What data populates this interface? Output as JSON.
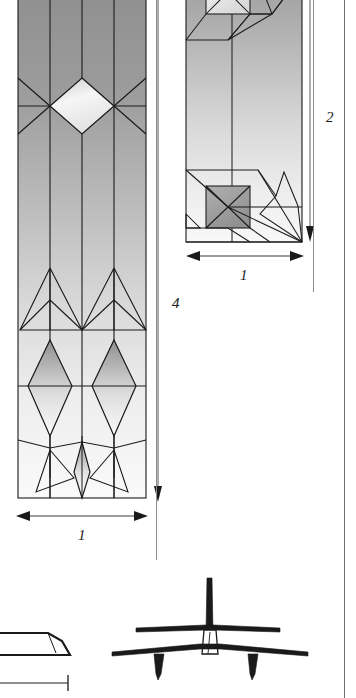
{
  "figure": {
    "type": "technical-diagram",
    "background_color": "#ffffff",
    "line_color": "#1a1a1a",
    "rule_color": "#8d8d8d"
  },
  "panels": {
    "left": {
      "name": "tall-flowfield-panel",
      "x": 18,
      "y": -20,
      "width": 128,
      "height": 518,
      "stripes": 4,
      "fill_top": "#9a9a9a",
      "fill_bottom": "#f2f2f2"
    },
    "right": {
      "name": "upper-flowfield-panel",
      "x": 186,
      "y": -30,
      "width": 116,
      "height": 272,
      "fill_top": "#a2a2a2",
      "fill_bottom": "#efefef"
    }
  },
  "dimensions": [
    {
      "id": "left-height",
      "label": "4",
      "orientation": "vertical",
      "label_x": 167,
      "label_y": 303
    },
    {
      "id": "left-width",
      "label": "1",
      "orientation": "horizontal",
      "label_x": 82,
      "label_y": 535
    },
    {
      "id": "right-height",
      "label": "2",
      "orientation": "vertical",
      "label_x": 332,
      "label_y": 117
    },
    {
      "id": "right-width",
      "label": "1",
      "orientation": "horizontal",
      "label_x": 252,
      "label_y": 272
    }
  ],
  "aircraft_views": [
    {
      "id": "side-view",
      "name": "aircraft-side-view-partial",
      "x": -40,
      "y": 600
    },
    {
      "id": "front-view",
      "name": "aircraft-front-view",
      "x": 110,
      "y": 575
    }
  ],
  "page_rules": [
    {
      "id": "left-inner-rule",
      "x": 156,
      "y": 0,
      "width": 1,
      "height": 560
    },
    {
      "id": "right-outer-rule",
      "x": 344,
      "y": 0,
      "width": 1,
      "height": 698
    },
    {
      "id": "right-inner-rule",
      "x": 313,
      "y": 0,
      "width": 1,
      "height": 290
    }
  ]
}
